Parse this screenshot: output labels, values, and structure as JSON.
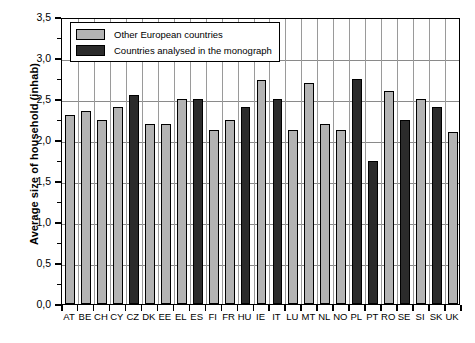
{
  "chart_data": {
    "type": "bar",
    "title": "",
    "xlabel": "",
    "ylabel": "Average size of household (inhab)",
    "ylim": [
      0.0,
      3.5
    ],
    "ytick_step": 0.5,
    "yminor_step": 0.25,
    "grid": true,
    "legend_position": "top-left",
    "decimal_separator": ",",
    "categories": [
      "AT",
      "BE",
      "CH",
      "CY",
      "CZ",
      "DK",
      "EE",
      "EL",
      "ES",
      "FI",
      "FR",
      "HU",
      "IE",
      "IT",
      "LU",
      "MT",
      "NL",
      "NO",
      "PL",
      "PT",
      "RO",
      "SE",
      "SI",
      "SK",
      "UK"
    ],
    "values": [
      2.3,
      2.35,
      2.25,
      2.4,
      2.55,
      2.2,
      2.2,
      2.5,
      2.5,
      2.12,
      2.25,
      2.4,
      2.73,
      2.5,
      2.12,
      2.7,
      2.2,
      2.12,
      2.75,
      1.75,
      2.6,
      2.25,
      2.5,
      2.4,
      2.1
    ],
    "groups": [
      "other",
      "other",
      "other",
      "other",
      "monograph",
      "other",
      "other",
      "other",
      "monograph",
      "other",
      "other",
      "monograph",
      "other",
      "monograph",
      "other",
      "other",
      "other",
      "other",
      "monograph",
      "monograph",
      "other",
      "monograph",
      "other",
      "monograph",
      "other"
    ],
    "series": [
      {
        "name": "Other European countries",
        "color": "#b3b3b3"
      },
      {
        "name": "Countries analysed in the monograph",
        "color": "#2b2b2b"
      }
    ],
    "ytick_labels": [
      "0,0",
      "0,5",
      "1,0",
      "1,5",
      "2,0",
      "2,5",
      "3,0",
      "3,5"
    ],
    "ytick_values": [
      0.0,
      0.5,
      1.0,
      1.5,
      2.0,
      2.5,
      3.0,
      3.5
    ]
  },
  "legend": {
    "items": [
      {
        "label": "Other European countries",
        "swatch": "light"
      },
      {
        "label": "Countries analysed in the monograph",
        "swatch": "dark"
      }
    ]
  },
  "axes": {
    "y_title": "Average size of household (inhab)"
  }
}
